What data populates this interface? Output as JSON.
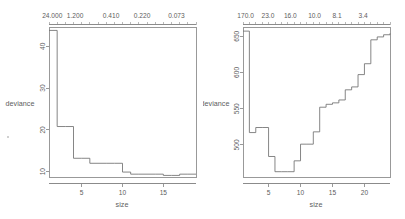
{
  "figure": {
    "title": "",
    "background": "#ffffff",
    "line_color": "#707070",
    "text_color": "#5d5d5d",
    "panel_count": 2
  },
  "chart_data": [
    {
      "type": "line",
      "id": "left-panel",
      "title": "",
      "xlabel": "size",
      "ylabel": "deviance",
      "top_axis_label": "",
      "xlim": [
        1,
        19
      ],
      "ylim": [
        8.6,
        44.5
      ],
      "grid": false,
      "legend": null,
      "step": "post",
      "xticks": [
        5,
        10,
        15
      ],
      "xticklabels": [
        "5",
        "10",
        "15"
      ],
      "yticks": [
        10,
        20,
        30,
        40
      ],
      "yticklabels": [
        "10",
        "20",
        "30",
        "40"
      ],
      "top_ticklabels": [
        "24.000",
        "1.200",
        "0.410",
        "0.220",
        "0.073"
      ],
      "top_tickpositions": [
        1.4,
        4.2,
        8.6,
        12.4,
        16.6
      ],
      "top_minor_count": 19,
      "x": [
        1,
        2,
        3,
        4,
        5,
        6,
        7,
        8,
        9,
        10,
        11,
        12,
        13,
        14,
        15,
        16,
        17,
        18,
        19
      ],
      "y": [
        43.8,
        20.8,
        20.8,
        13.2,
        13.2,
        12.0,
        12.0,
        12.0,
        12.0,
        9.9,
        9.4,
        9.4,
        9.4,
        9.4,
        9.1,
        9.1,
        9.4,
        9.4,
        9.4
      ]
    },
    {
      "type": "line",
      "id": "right-panel",
      "title": "",
      "xlabel": "size",
      "ylabel": "deviance",
      "top_axis_label": "",
      "xlim": [
        1,
        24
      ],
      "ylim": [
        455,
        662
      ],
      "grid": false,
      "legend": null,
      "step": "post",
      "xticks": [
        5,
        10,
        15,
        20
      ],
      "xticklabels": [
        "5",
        "10",
        "15",
        "20"
      ],
      "yticks": [
        500,
        550,
        600,
        650
      ],
      "yticklabels": [
        "500",
        "550",
        "600",
        "650"
      ],
      "top_ticklabels": [
        "170.0",
        "23.0",
        "16.0",
        "10.0",
        "8.1",
        "3.4"
      ],
      "top_tickpositions": [
        1.4,
        4.9,
        8.4,
        12.2,
        15.7,
        19.8
      ],
      "top_minor_count": 24,
      "x": [
        1,
        2,
        3,
        4,
        5,
        6,
        7,
        8,
        9,
        10,
        11,
        12,
        13,
        14,
        15,
        16,
        17,
        18,
        19,
        20,
        21,
        22,
        23,
        24
      ],
      "y": [
        657,
        517,
        524,
        524,
        484,
        463,
        463,
        463,
        478,
        501,
        501,
        518,
        552,
        556,
        558,
        562,
        576,
        580,
        597,
        612,
        645,
        649,
        652,
        654
      ]
    }
  ]
}
